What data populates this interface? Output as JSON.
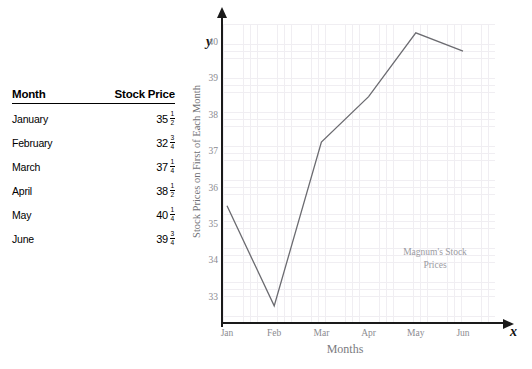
{
  "table": {
    "headers": [
      "Month",
      "Stock Price"
    ],
    "rows": [
      {
        "month": "January",
        "whole": "35",
        "num": "1",
        "den": "2"
      },
      {
        "month": "February",
        "whole": "32",
        "num": "3",
        "den": "4"
      },
      {
        "month": "March",
        "whole": "37",
        "num": "1",
        "den": "4"
      },
      {
        "month": "April",
        "whole": "38",
        "num": "1",
        "den": "2"
      },
      {
        "month": "May",
        "whole": "40",
        "num": "1",
        "den": "4"
      },
      {
        "month": "June",
        "whole": "39",
        "num": "3",
        "den": "4"
      }
    ]
  },
  "chart_data": {
    "type": "line",
    "title": "",
    "annotation": "Magnum's Stock\nPrices",
    "annotation_line1": "Magnum's Stock",
    "annotation_line2": "Prices",
    "xlabel": "Months",
    "ylabel": "Stock Prices on First of Each Month",
    "x_axis_var": "x",
    "y_axis_var": "y",
    "categories": [
      "Jan",
      "Feb",
      "Mar",
      "Apr",
      "May",
      "Jun"
    ],
    "values": [
      35.5,
      32.75,
      37.25,
      38.5,
      40.25,
      39.75
    ],
    "yticks": [
      33,
      34,
      35,
      36,
      37,
      38,
      39,
      40
    ],
    "ylim": [
      32.4,
      40.6
    ],
    "grid": true,
    "legend": "none",
    "line_color": "#6b6b70"
  }
}
